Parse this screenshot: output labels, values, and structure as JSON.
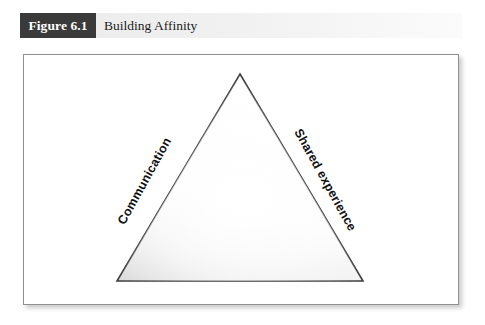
{
  "figure": {
    "number_label": "Figure 6.1",
    "title": "Building Affinity"
  },
  "diagram": {
    "type": "triangle-model",
    "labels": {
      "left_side": "Communication",
      "right_side": "Shared experience",
      "base": "Affinity"
    }
  },
  "colors": {
    "chip_background": "#3a3a3a",
    "chip_text": "#ffffff",
    "caption_band": "#efefef",
    "frame_border": "#909090",
    "triangle_stroke": "#3d3d3d",
    "triangle_fill_light": "#ffffff",
    "triangle_fill_shade": "#dcdcdc",
    "label_text": "#121212"
  }
}
